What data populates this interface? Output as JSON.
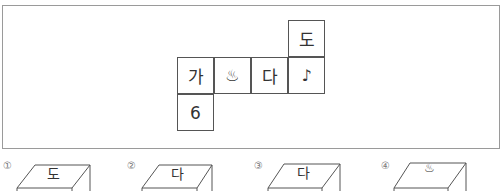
{
  "net": {
    "cells": [
      {
        "row": 0,
        "col": 3,
        "label": "도"
      },
      {
        "row": 1,
        "col": 0,
        "label": "가"
      },
      {
        "row": 1,
        "col": 1,
        "label": "♨"
      },
      {
        "row": 1,
        "col": 2,
        "label": "다"
      },
      {
        "row": 1,
        "col": 3,
        "label": "♪"
      },
      {
        "row": 2,
        "col": 0,
        "label": "6"
      }
    ]
  },
  "options": [
    {
      "number": "①",
      "top_face": "도"
    },
    {
      "number": "②",
      "top_face": "다"
    },
    {
      "number": "③",
      "top_face": "다"
    },
    {
      "number": "④",
      "top_face": "♨"
    }
  ],
  "colors": {
    "frame_border": "#9a9a9a",
    "line": "#555555"
  }
}
